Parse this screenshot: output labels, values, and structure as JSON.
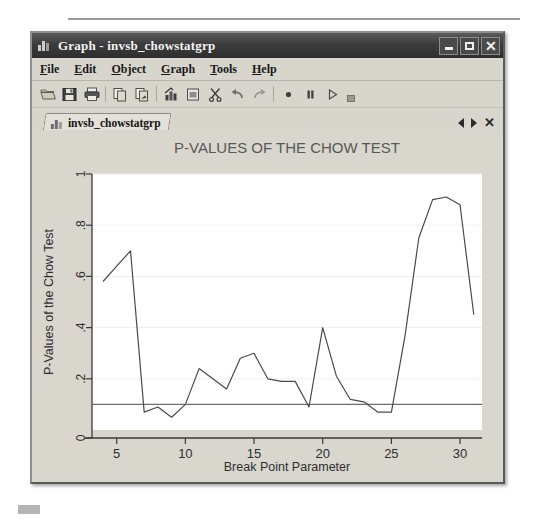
{
  "window": {
    "title": "Graph - invsb_chowstatgrp",
    "icon": "bar-chart-icon",
    "controls": {
      "minimize": "minimize-button",
      "maximize": "maximize-button",
      "close": "close-button"
    }
  },
  "menubar": {
    "items": [
      {
        "label": "File",
        "accel": "F"
      },
      {
        "label": "Edit",
        "accel": "E"
      },
      {
        "label": "Object",
        "accel": "O"
      },
      {
        "label": "Graph",
        "accel": "G"
      },
      {
        "label": "Tools",
        "accel": "T"
      },
      {
        "label": "Help",
        "accel": "H"
      }
    ]
  },
  "toolbar": {
    "buttons": [
      {
        "name": "open-icon"
      },
      {
        "name": "save-icon"
      },
      {
        "name": "print-icon"
      },
      {
        "name": "copy-icon"
      },
      {
        "name": "paste-icon"
      },
      {
        "name": "graph-editor-icon"
      },
      {
        "name": "new-graph-icon"
      },
      {
        "name": "cut-icon"
      },
      {
        "name": "undo-icon"
      },
      {
        "name": "redo-icon"
      },
      {
        "name": "record-icon"
      },
      {
        "name": "pause-icon"
      },
      {
        "name": "play-icon"
      }
    ],
    "overflow": "toolbar-overflow-handle"
  },
  "tabstrip": {
    "tabs": [
      {
        "label": "invsb_chowstatgrp",
        "icon": "bar-chart-icon",
        "active": true
      }
    ],
    "prev": "◄",
    "next": "►",
    "close": "✕"
  },
  "chart_data": {
    "type": "line",
    "title": "P-VALUES OF THE CHOW TEST",
    "xlabel": "Break Point Parameter",
    "ylabel": "P-Values of the Chow Test",
    "xlim": [
      3.2,
      31.6
    ],
    "ylim": [
      0,
      1
    ],
    "xticks": [
      5,
      10,
      15,
      20,
      25,
      30
    ],
    "xticklabels": [
      "5",
      "10",
      "15",
      "20",
      "25",
      "30"
    ],
    "yticks": [
      0,
      0.2,
      0.4,
      0.6,
      0.8,
      1
    ],
    "yticklabels": [
      "0",
      ".2",
      ".4",
      ".6",
      ".8",
      "1"
    ],
    "grid": "horizontal",
    "legend": "none",
    "reference_line": {
      "y": 0.1,
      "orientation": "horizontal"
    },
    "series": [
      {
        "name": "P-Values of the Chow Test",
        "color": "#4a4a4a",
        "x": [
          4,
          5,
          6,
          7,
          8,
          9,
          10,
          11,
          12,
          13,
          14,
          15,
          16,
          17,
          18,
          19,
          20,
          21,
          22,
          23,
          24,
          25,
          26,
          27,
          28,
          29,
          30,
          31
        ],
        "y": [
          0.58,
          0.64,
          0.7,
          0.07,
          0.09,
          0.05,
          0.1,
          0.24,
          0.2,
          0.16,
          0.28,
          0.3,
          0.2,
          0.19,
          0.19,
          0.09,
          0.4,
          0.21,
          0.12,
          0.11,
          0.07,
          0.07,
          0.37,
          0.75,
          0.9,
          0.91,
          0.88,
          0.45
        ]
      }
    ]
  }
}
